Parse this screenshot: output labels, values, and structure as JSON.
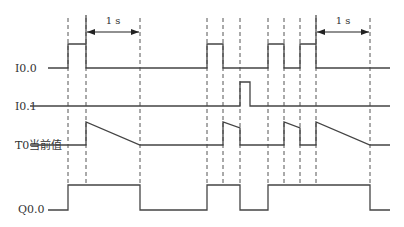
{
  "colors": {
    "line": "#444444",
    "background": "#ffffff",
    "text": "#333333"
  },
  "signals": [
    {
      "name": "I0.0",
      "label": "I0.0",
      "type": "digital",
      "low_y": 68,
      "high_y": 44,
      "high_intervals": [
        [
          68,
          86
        ],
        [
          207,
          223
        ],
        [
          268,
          284
        ],
        [
          300,
          316
        ]
      ]
    },
    {
      "name": "I0.1",
      "label": "I0.1",
      "type": "digital",
      "low_y": 106,
      "high_y": 82,
      "high_intervals": [
        [
          240,
          250
        ]
      ]
    },
    {
      "name": "T0",
      "label": "T0当前值",
      "type": "ramp",
      "base_y": 145,
      "ramps": [
        {
          "start_x": 86,
          "start_y": 122,
          "end_x": 140,
          "end_y": 145,
          "reset": "timeout"
        },
        {
          "start_x": 223,
          "start_y": 122,
          "end_x": 240,
          "end_y": 128,
          "reset": "I0.1"
        },
        {
          "start_x": 284,
          "start_y": 122,
          "end_x": 300,
          "end_y": 128,
          "reset": "I0.0"
        },
        {
          "start_x": 316,
          "start_y": 122,
          "end_x": 370,
          "end_y": 145,
          "reset": "timeout"
        }
      ]
    },
    {
      "name": "Q0.0",
      "label": "Q0.0",
      "type": "digital",
      "low_y": 210,
      "high_y": 185,
      "high_intervals": [
        [
          68,
          140
        ],
        [
          207,
          240
        ],
        [
          268,
          370
        ]
      ]
    }
  ],
  "dashed_lines_x": [
    68,
    86,
    140,
    207,
    223,
    240,
    268,
    284,
    300,
    316,
    370
  ],
  "dimensions": [
    {
      "label": "1 s",
      "from_x": 86,
      "to_x": 140,
      "y": 32
    },
    {
      "label": "1 s",
      "from_x": 316,
      "to_x": 370,
      "y": 32
    }
  ],
  "x_range": [
    40,
    390
  ]
}
